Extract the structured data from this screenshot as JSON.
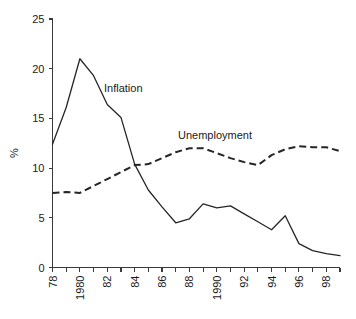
{
  "chart_data": {
    "type": "line",
    "title": "",
    "subtitle": "",
    "xlabel": "",
    "ylabel": "%",
    "ylim": [
      0,
      25
    ],
    "yticks": [
      0,
      5,
      10,
      15,
      20,
      25
    ],
    "ytick_labels": [
      "0",
      "5",
      "10",
      "15",
      "20",
      "25"
    ],
    "xlim": [
      1978,
      1999
    ],
    "x": [
      1978,
      1979,
      1980,
      1981,
      1982,
      1983,
      1984,
      1985,
      1986,
      1987,
      1988,
      1989,
      1990,
      1991,
      1992,
      1993,
      1994,
      1995,
      1996,
      1997,
      1998,
      1999
    ],
    "xtick_labels": [
      "78",
      "",
      "1980",
      "",
      "82",
      "",
      "84",
      "",
      "86",
      "",
      "88",
      "",
      "1990",
      "",
      "92",
      "",
      "94",
      "",
      "96",
      "",
      "98",
      ""
    ],
    "xtick_labels_shown": [
      "78",
      "1980",
      "82",
      "84",
      "86",
      "88",
      "1990",
      "92",
      "94",
      "96",
      "98"
    ],
    "xtick_rotation_degrees": -90,
    "grid": false,
    "legend_position": "inline-annotation",
    "series": [
      {
        "name": "Inflation",
        "style": "solid",
        "color": "#262626",
        "values": [
          12.4,
          16.1,
          21.0,
          19.3,
          16.4,
          15.1,
          10.4,
          7.8,
          6.1,
          4.5,
          4.9,
          6.4,
          6.0,
          6.2,
          5.4,
          4.6,
          3.8,
          5.2,
          2.4,
          1.7,
          1.4,
          1.2
        ]
      },
      {
        "name": "Unemployment",
        "style": "dashed",
        "color": "#262626",
        "values": [
          7.5,
          7.6,
          7.5,
          8.2,
          8.9,
          9.6,
          10.3,
          10.4,
          11.0,
          11.6,
          12.0,
          12.0,
          11.5,
          11.0,
          10.6,
          10.3,
          11.3,
          11.9,
          12.2,
          12.1,
          12.1,
          11.7
        ]
      }
    ],
    "annotations": [
      {
        "name": "inflation-label",
        "text": "Inflation",
        "x_px": 104,
        "y_px": 92
      },
      {
        "name": "unemployment-label",
        "text": "Unemployment",
        "x_px": 178,
        "y_px": 139
      }
    ],
    "axis_label_y": "%"
  }
}
